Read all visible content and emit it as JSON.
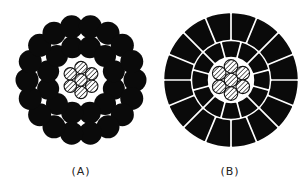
{
  "figure": {
    "colors": {
      "conductor": "#0a0a0a",
      "core_hatch": "#333333",
      "background": "#ffffff"
    },
    "panels": [
      {
        "id": "A",
        "label": "(A)",
        "type": "round-wire",
        "core_strands": 7,
        "layers": [
          {
            "name": "inner",
            "strands": 12
          },
          {
            "name": "outer",
            "strands": 18
          }
        ]
      },
      {
        "id": "B",
        "label": "(B)",
        "type": "shaped-segment",
        "core_strands": 7,
        "layers": [
          {
            "name": "inner",
            "strands": 12
          },
          {
            "name": "outer",
            "strands": 16
          }
        ]
      }
    ]
  }
}
